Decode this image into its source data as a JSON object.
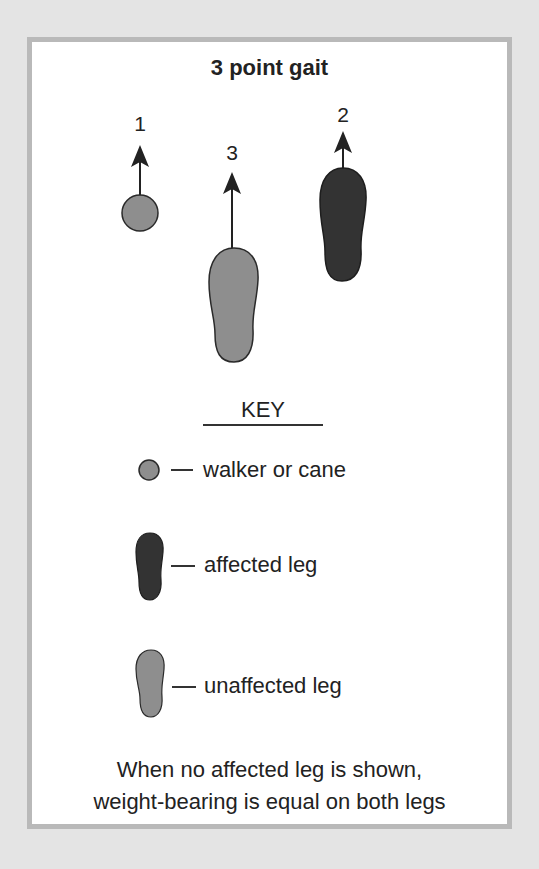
{
  "title": "3 point gait",
  "steps": [
    {
      "number": "1",
      "item": "walker or cane"
    },
    {
      "number": "2",
      "item": "affected leg"
    },
    {
      "number": "3",
      "item": "unaffected leg"
    }
  ],
  "key": {
    "heading": "KEY",
    "items": [
      {
        "symbol": "circle-icon",
        "label": "walker or cane",
        "dash": "—"
      },
      {
        "symbol": "affected-foot-icon",
        "label": "affected leg",
        "dash": "—"
      },
      {
        "symbol": "unaffected-foot-icon",
        "label": "unaffected leg",
        "dash": "—"
      }
    ]
  },
  "footnote": {
    "line1": "When no affected leg is shown,",
    "line2": "weight-bearing is equal on both legs"
  },
  "colors": {
    "background": "#e4e4e4",
    "border": "#b9b9b9",
    "panel": "#ffffff",
    "walker_fill": "#8e8e8e",
    "unaffected_fill": "#8e8e8e",
    "affected_fill": "#333333",
    "outline": "#2a2a2a"
  }
}
